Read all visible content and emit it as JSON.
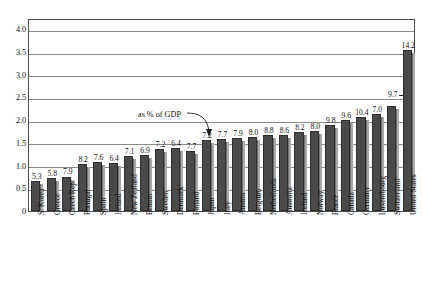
{
  "chart_data": {
    "type": "bar",
    "title": "",
    "subtitle": "",
    "xlabel": "",
    "ylabel": "",
    "ylim": [
      0,
      4.25
    ],
    "grid": true,
    "legend_position": "none",
    "annotation": "as % of GDP",
    "ytick_labels": [
      "0",
      "0.5",
      "1.0",
      "1.5",
      "2.0",
      "2.5",
      "3.0",
      "3.5",
      "4.0"
    ],
    "ytick_values": [
      0,
      0.5,
      1.0,
      1.5,
      2.0,
      2.5,
      3.0,
      3.5,
      4.0
    ],
    "categories": [
      "S. Korea",
      "Greece",
      "Czech Rep.",
      "Portugal",
      "Spain",
      "Ireland",
      "New Zealand",
      "Britain",
      "Sweden",
      "Denmark",
      "Finland",
      "Japan",
      "Italy",
      "Austria",
      "Belgium",
      "Netherlands",
      "Australia",
      "Iceland",
      "Norway",
      "France",
      "Canada",
      "Germany",
      "Luxembourg",
      "Switzerland",
      "United States"
    ],
    "values": [
      0.67,
      0.72,
      0.76,
      1.03,
      1.07,
      1.05,
      1.21,
      1.23,
      1.36,
      1.38,
      1.33,
      1.56,
      1.58,
      1.61,
      1.62,
      1.67,
      1.67,
      1.74,
      1.77,
      1.89,
      2.0,
      2.06,
      2.13,
      2.32,
      3.55
    ],
    "point_labels": [
      "5.3",
      "5.8",
      "7.9",
      "8.2",
      "7.6",
      "6.4",
      "7.1",
      "6.9",
      "7.2",
      "6.4",
      "7.7",
      "7.2",
      "7.7",
      "7.9",
      "8.0",
      "8.8",
      "8.6",
      "8.2",
      "8.0",
      "9.8",
      "9.6",
      "10.4",
      "7.0",
      "9.7",
      "14.2"
    ],
    "point_label_meaning": "as % of GDP"
  }
}
